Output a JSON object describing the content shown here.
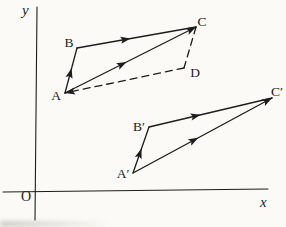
{
  "figure": {
    "description_labels": [
      "y",
      "x",
      "O",
      "A",
      "B",
      "C",
      "D",
      "A′",
      "B′",
      "C′"
    ],
    "ink_color": "#1d1d1b",
    "background_color": "#fbfaf6",
    "axes": {
      "y_label": "y",
      "x_label": "x",
      "origin_label": "O",
      "y_line": {
        "x1": 37,
        "y1": 7,
        "x2": 35,
        "y2": 220
      },
      "x_line": {
        "x1": 3,
        "y1": 192,
        "x2": 268,
        "y2": 189
      }
    },
    "points": {
      "A": {
        "x": 65,
        "y": 93,
        "label": "A",
        "lx": 56,
        "ly": 100
      },
      "B": {
        "x": 77,
        "y": 48,
        "label": "B",
        "lx": 69,
        "ly": 47
      },
      "C": {
        "x": 196,
        "y": 27,
        "label": "C",
        "lx": 202,
        "ly": 26
      },
      "D": {
        "x": 184,
        "y": 68,
        "label": "D",
        "lx": 195,
        "ly": 77
      },
      "Ap": {
        "x": 133,
        "y": 173,
        "label": "A′",
        "lx": 123,
        "ly": 178
      },
      "Bp": {
        "x": 149,
        "y": 127,
        "label": "B′",
        "lx": 139,
        "ly": 131
      },
      "Cp": {
        "x": 272,
        "y": 98,
        "label": "C′",
        "lx": 277,
        "ly": 96
      }
    },
    "edges": [
      {
        "from": "A",
        "to": "B",
        "style": "solid",
        "arrows": [
          0.55
        ]
      },
      {
        "from": "B",
        "to": "C",
        "style": "solid",
        "arrows": [
          0.45
        ]
      },
      {
        "from": "A",
        "to": "C",
        "style": "solid",
        "arrows": [
          0.47,
          1
        ]
      },
      {
        "from": "C",
        "to": "D",
        "style": "dashed",
        "arrows": []
      },
      {
        "from": "D",
        "to": "A",
        "style": "dashed",
        "arrows": [
          1
        ]
      },
      {
        "from": "Ap",
        "to": "Bp",
        "style": "solid",
        "arrows": [
          0.53
        ]
      },
      {
        "from": "Bp",
        "to": "Cp",
        "style": "solid",
        "arrows": [
          0.42
        ]
      },
      {
        "from": "Ap",
        "to": "Cp",
        "style": "solid",
        "arrows": [
          0.47,
          1
        ]
      }
    ]
  }
}
